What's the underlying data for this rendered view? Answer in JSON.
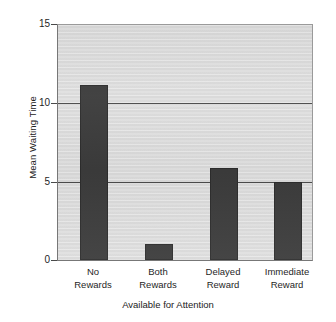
{
  "chart_data": {
    "type": "bar",
    "title": "",
    "subtitle": "",
    "xlabel": "Available for Attention",
    "ylabel": "Mean Waiting Time",
    "categories": [
      "No Rewards",
      "Both Rewards",
      "Delayed Reward",
      "Immediate Reward"
    ],
    "category_lines": [
      [
        "No",
        "Rewards"
      ],
      [
        "Both",
        "Rewards"
      ],
      [
        "Delayed",
        "Reward"
      ],
      [
        "Immediate",
        "Reward"
      ]
    ],
    "values": [
      11.2,
      1.0,
      5.9,
      5.0
    ],
    "ylim": [
      0,
      15
    ],
    "yticks": [
      0,
      5,
      10,
      15
    ],
    "ytick_labels": [
      "0",
      "5",
      "10",
      "15"
    ],
    "grid": "horizontal",
    "gridlines_at": [
      5,
      10,
      15
    ],
    "legend": "none",
    "bar_color": "#3b3b3b",
    "plot_background": "#dddddd",
    "page_background": "#ffffff",
    "axis_color": "#4a4a4a"
  }
}
